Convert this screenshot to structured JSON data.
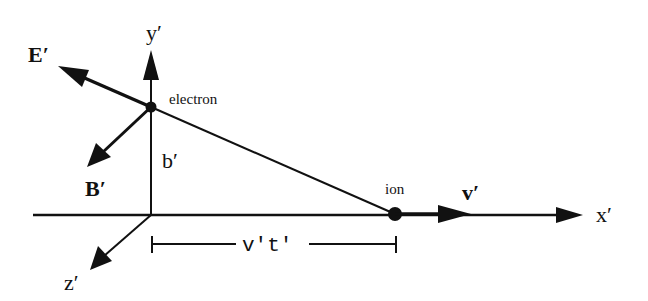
{
  "diagram": {
    "type": "physics-vector-diagram",
    "colors": {
      "ink": "#111111",
      "background": "#ffffff"
    },
    "axes": {
      "x_label": "x′",
      "y_label": "y′",
      "z_label": "z′"
    },
    "particles": {
      "electron_label": "electron",
      "ion_label": "ion"
    },
    "vectors": {
      "electric_field_label": "E′",
      "magnetic_field_label": "B′",
      "velocity_label": "v′"
    },
    "distances": {
      "impact_parameter_label": "b′",
      "displacement_label": "v′t′"
    }
  }
}
